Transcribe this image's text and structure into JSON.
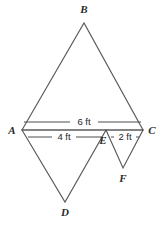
{
  "figure": {
    "kind": "geometry-diagram",
    "background_color": "#ffffff",
    "stroke_color": "#5a5a5a",
    "label_color": "#2b2b2b",
    "width": 161,
    "height": 226,
    "vertices": [
      {
        "id": "A",
        "label": "A",
        "x": 22,
        "y": 130,
        "label_x": 12,
        "label_y": 134
      },
      {
        "id": "B",
        "label": "B",
        "x": 84,
        "y": 23,
        "label_x": 84,
        "label_y": 13
      },
      {
        "id": "C",
        "label": "C",
        "x": 143,
        "y": 130,
        "label_x": 152,
        "label_y": 134
      },
      {
        "id": "D",
        "label": "D",
        "x": 65,
        "y": 202,
        "label_x": 65,
        "label_y": 216
      },
      {
        "id": "E",
        "label": "E",
        "x": 106,
        "y": 130,
        "label_x": 103,
        "label_y": 144
      },
      {
        "id": "F",
        "label": "F",
        "x": 123,
        "y": 168,
        "label_x": 123,
        "label_y": 182
      }
    ],
    "triangles": [
      {
        "name": "triangle-abc",
        "points": "22,130 84,23 143,130"
      },
      {
        "name": "triangle-ade",
        "points": "22,130 65,202 106,130"
      },
      {
        "name": "triangle-ecf",
        "points": "106,130 123,168 143,130"
      }
    ],
    "dimensions": [
      {
        "id": "dim-ac",
        "label": "6 ft",
        "segment": "A-C",
        "label_x": 84,
        "label_y": 125,
        "line_y": 122,
        "left_x": 24,
        "right_x": 141,
        "gap_left": 70,
        "gap_right": 98
      },
      {
        "id": "dim-ae",
        "label": "4 ft",
        "segment": "A-E",
        "label_x": 64,
        "label_y": 140,
        "line_y": 137,
        "left_x": 28,
        "right_x": 102,
        "gap_left": 52,
        "gap_right": 76
      },
      {
        "id": "dim-ec",
        "label": "2 ft",
        "segment": "E-C",
        "label_x": 125,
        "label_y": 140,
        "line_y": 137,
        "left_x": 111,
        "right_x": 139,
        "gap_left": 114,
        "gap_right": 136
      }
    ]
  }
}
